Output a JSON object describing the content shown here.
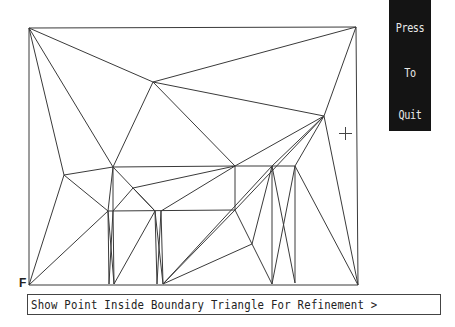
{
  "quit_panel": {
    "line1": "Press",
    "line2": "To",
    "line3": "Quit"
  },
  "corner_label": "F",
  "prompt": {
    "text": "Show Point Inside Boundary Triangle For  Refinement >"
  },
  "cursor": {
    "icon": "crosshair-icon"
  },
  "colors": {
    "background": "#ffffff",
    "mesh_line": "#3a3a3a",
    "panel": "#141414",
    "panel_text": "#e8e8e8"
  }
}
